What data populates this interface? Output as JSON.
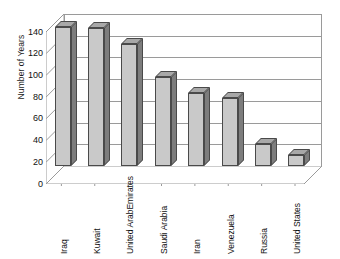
{
  "chart_data": {
    "type": "bar",
    "title": "",
    "xlabel": "",
    "ylabel": "Number of Years",
    "categories": [
      "Iraq",
      "Kuwait",
      "United Arab Emirates",
      "Saudi Arabia",
      "Iran",
      "Venezuela",
      "Russia",
      "United States"
    ],
    "values": [
      128,
      127,
      112,
      82,
      67,
      63,
      20,
      10
    ],
    "ylim": [
      0,
      140
    ],
    "yticks": [
      0,
      20,
      40,
      60,
      80,
      100,
      120,
      140
    ],
    "ytick_labels": [
      "0",
      "20",
      "40",
      "60",
      "80",
      "100",
      "120",
      "140"
    ],
    "grid": true,
    "legend": "none",
    "style": "3d-column",
    "series": [
      {
        "name": "Number of Years",
        "values": [
          128,
          127,
          112,
          82,
          67,
          63,
          20,
          10
        ]
      }
    ],
    "colors": {
      "bar_front": "#c9c9c9",
      "bar_side": "#7d7d7d",
      "bar_top": "#a8a8a8",
      "bar_outline": "#4a4a4a",
      "gridline": "#9a9a9a",
      "background": "#ffffff",
      "text": "#111111"
    }
  },
  "axis": {
    "y_title": "Number of Years"
  },
  "xlabels": [
    {
      "lines": [
        "Iraq"
      ]
    },
    {
      "lines": [
        "Kuwait"
      ]
    },
    {
      "lines": [
        "United Arab",
        "Emirates"
      ]
    },
    {
      "lines": [
        "Saudi Arabia"
      ]
    },
    {
      "lines": [
        "Iran"
      ]
    },
    {
      "lines": [
        "Venezuela"
      ]
    },
    {
      "lines": [
        "Russia"
      ]
    },
    {
      "lines": [
        "United States"
      ]
    }
  ]
}
